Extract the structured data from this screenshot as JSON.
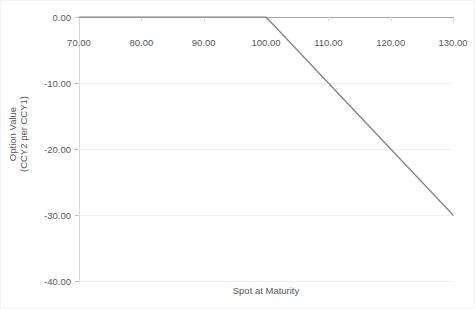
{
  "chart_data": {
    "type": "line",
    "title": "",
    "xlabel": "Spot at Maturity",
    "ylabel_lines": [
      "Option Value",
      "(CCY2 per CCY1)"
    ],
    "ylabel": "Option Value (CCY2 per CCY1)",
    "xlim": [
      70,
      130
    ],
    "ylim": [
      -40,
      0
    ],
    "xticks": [
      70,
      80,
      90,
      100,
      110,
      120,
      130
    ],
    "xtick_labels": [
      "70.00",
      "80.00",
      "90.00",
      "100.00",
      "110.00",
      "120.00",
      "130.00"
    ],
    "yticks": [
      0,
      -10,
      -20,
      -30,
      -40
    ],
    "ytick_labels": [
      "0.00",
      "-10.00",
      "-20.00",
      "-30.00",
      "-40.00"
    ],
    "grid": {
      "horizontal": true,
      "vertical": false
    },
    "legend": {
      "visible": false,
      "position": "none"
    },
    "series": [
      {
        "name": "Option Value",
        "color": "#808080",
        "width": 1.2,
        "x": [
          70,
          75,
          80,
          85,
          90,
          95,
          100,
          105,
          110,
          115,
          120,
          125,
          130
        ],
        "values": [
          0,
          0,
          0,
          0,
          0,
          0,
          0,
          -5,
          -10,
          -15,
          -20,
          -25,
          -30
        ],
        "points": [
          [
            70,
            0
          ],
          [
            100,
            0
          ],
          [
            130,
            -30
          ]
        ],
        "annotation": "Short call payoff: flat at 0 below strike 100, then linear decline to -30 at spot 130"
      }
    ]
  },
  "colors": {
    "background": "#ffffff",
    "series_line": "#808080",
    "gridline": "#f0f0f0",
    "zero_axis": "#a6a6a6",
    "axis_spine": "#d9d9d9",
    "tick_mark": "#bfbfbf",
    "text": "#595959",
    "frame_border": "#f2f2f2"
  }
}
